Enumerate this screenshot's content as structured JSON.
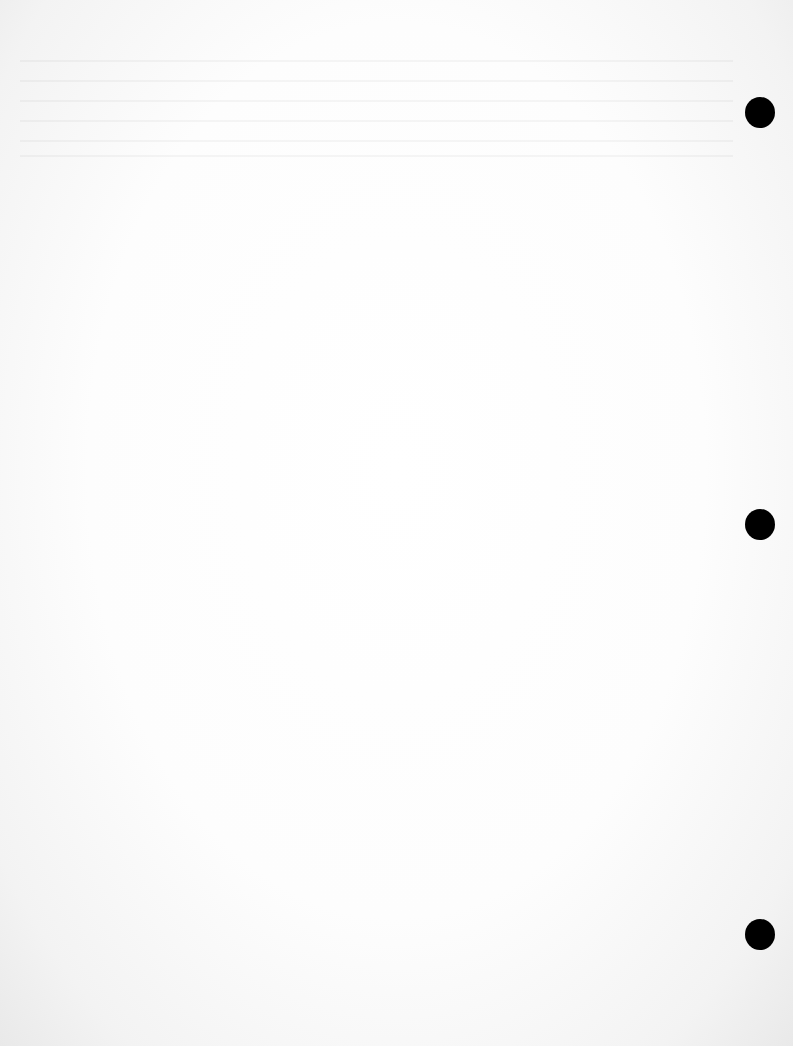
{
  "document": {
    "type": "blank scanned page",
    "text": ""
  },
  "punch_holes": [
    {
      "cx": 760,
      "cy": 112
    },
    {
      "cx": 760,
      "cy": 524
    },
    {
      "cx": 760,
      "cy": 934
    }
  ],
  "colors": {
    "paper": "#ffffff",
    "hole": "#000000"
  }
}
